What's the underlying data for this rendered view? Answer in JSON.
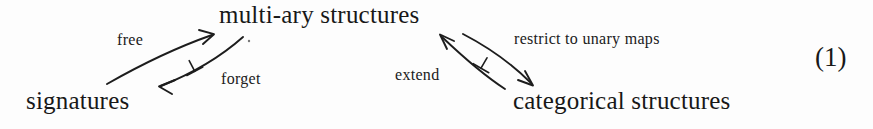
{
  "figure": {
    "type": "commutative-diagram",
    "equation_number": "(1)",
    "background_color": "#fdfdfd",
    "ink_color": "#1d1d1d",
    "nodes": [
      {
        "id": "multiary",
        "label": "multi-ary structures",
        "position": "top-center"
      },
      {
        "id": "signatures",
        "label": "signatures",
        "position": "bottom-left"
      },
      {
        "id": "categorical",
        "label": "categorical structures",
        "position": "bottom-right"
      }
    ],
    "arrows": [
      {
        "id": "free",
        "label": "free",
        "from": "signatures",
        "to": "multiary",
        "direction": "up-right"
      },
      {
        "id": "forget",
        "label": "forget",
        "from": "multiary",
        "to": "signatures",
        "direction": "down-left"
      },
      {
        "id": "restrict",
        "label": "restrict to unary maps",
        "from": "multiary",
        "to": "categorical",
        "direction": "down-right"
      },
      {
        "id": "extend",
        "label": "extend",
        "from": "categorical",
        "to": "multiary",
        "direction": "up-left"
      }
    ],
    "adjunction_symbols": [
      {
        "id": "left-adjunction",
        "glyph": "⊥",
        "between": [
          "free",
          "forget"
        ]
      },
      {
        "id": "right-adjunction",
        "glyph": "⊥",
        "between": [
          "restrict",
          "extend"
        ]
      }
    ]
  }
}
